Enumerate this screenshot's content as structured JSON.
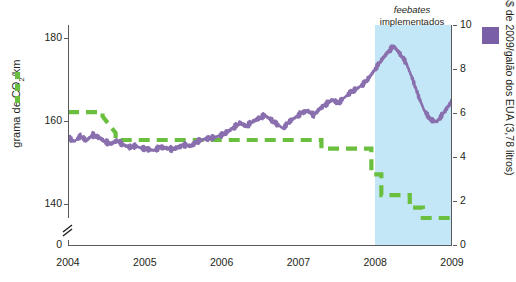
{
  "chart_data": {
    "type": "line",
    "title": "",
    "xlabel": "",
    "x_ticks": [
      "2004",
      "2005",
      "2006",
      "2007",
      "2008",
      "2009"
    ],
    "x_range": [
      2004,
      2009
    ],
    "grid": false,
    "annotations": [
      {
        "name": "feebate-annotation",
        "line1": "feebates",
        "line2": "implementados",
        "style": "italic-first-line"
      }
    ],
    "shaded_region": {
      "label": "feebates implementados",
      "from": 2008.0,
      "to": 2009.0,
      "color": "#c3e7f7"
    },
    "left_axis": {
      "label": "grama de CO₂/km",
      "ticks": [
        140,
        160,
        180
      ],
      "ylim": [
        130,
        183
      ],
      "axis_break": true,
      "zero_shown": "0"
    },
    "right_axis": {
      "label": "US$ de 2009/galão dos EUA (3,78 litros)",
      "ticks": [
        0,
        2,
        4,
        6,
        8,
        10
      ],
      "ylim": [
        0,
        10
      ]
    },
    "series": [
      {
        "name": "grama de CO₂/km",
        "axis": "left",
        "color": "#6abf3f",
        "style": "dashed-step",
        "x": [
          2004.0,
          2004.45,
          2004.45,
          2004.62,
          2004.62,
          2007.3,
          2007.3,
          2007.95,
          2007.95,
          2008.08,
          2008.08,
          2008.45,
          2008.45,
          2008.62,
          2008.62,
          2009.0
        ],
        "values": [
          162.0,
          162.0,
          161.0,
          157.0,
          155.3,
          155.3,
          153.2,
          153.2,
          147.0,
          147.0,
          142.0,
          142.0,
          139.0,
          139.0,
          136.5,
          136.5
        ]
      },
      {
        "name": "US$ de 2009/galão dos EUA (3,78 litros)",
        "axis": "right",
        "color": "#8a6fae",
        "style": "noisy-line",
        "x": [
          2004.0,
          2004.08,
          2004.16,
          2004.24,
          2004.32,
          2004.4,
          2004.48,
          2004.56,
          2004.64,
          2004.72,
          2004.8,
          2004.88,
          2004.96,
          2005.04,
          2005.12,
          2005.2,
          2005.28,
          2005.36,
          2005.44,
          2005.52,
          2005.6,
          2005.68,
          2005.76,
          2005.84,
          2005.92,
          2006.0,
          2006.08,
          2006.16,
          2006.24,
          2006.32,
          2006.4,
          2006.48,
          2006.56,
          2006.64,
          2006.72,
          2006.8,
          2006.88,
          2006.96,
          2007.04,
          2007.12,
          2007.2,
          2007.28,
          2007.36,
          2007.44,
          2007.52,
          2007.6,
          2007.68,
          2007.76,
          2007.84,
          2007.92,
          2008.0,
          2008.08,
          2008.16,
          2008.24,
          2008.32,
          2008.4,
          2008.48,
          2008.56,
          2008.64,
          2008.72,
          2008.8,
          2008.88,
          2008.96,
          2009.0
        ],
        "values": [
          4.9,
          4.7,
          4.95,
          4.75,
          5.0,
          4.9,
          4.7,
          4.6,
          4.75,
          4.55,
          4.45,
          4.5,
          4.4,
          4.35,
          4.3,
          4.45,
          4.4,
          4.35,
          4.45,
          4.55,
          4.5,
          4.7,
          4.8,
          4.85,
          4.9,
          5.0,
          5.15,
          5.35,
          5.55,
          5.4,
          5.6,
          5.75,
          5.9,
          5.7,
          5.5,
          5.3,
          5.6,
          5.8,
          6.0,
          6.1,
          5.9,
          6.2,
          6.4,
          6.6,
          6.45,
          6.7,
          6.95,
          7.1,
          7.3,
          7.6,
          8.0,
          8.4,
          8.75,
          9.05,
          8.7,
          8.3,
          7.6,
          6.8,
          6.1,
          5.7,
          5.6,
          5.95,
          6.35,
          6.55
        ]
      }
    ],
    "legend": [
      {
        "name": "legend-left",
        "swatch": "green-dashed",
        "color": "#6abf3f",
        "label": "grama de CO₂/km",
        "position": "left-axis"
      },
      {
        "name": "legend-right",
        "swatch": "purple-square",
        "color": "#7a5fa6",
        "label": "US$ de 2009/galão dos EUA (3,78 litros)",
        "position": "right-axis"
      }
    ]
  },
  "axes": {
    "left": {
      "title_pre": "grama de CO",
      "title_sub": "2",
      "title_post": "/km",
      "ticks": [
        {
          "label": "180",
          "value": 180
        },
        {
          "label": "160",
          "value": 160
        },
        {
          "label": "140",
          "value": 140
        },
        {
          "label": "0",
          "value": 0
        }
      ]
    },
    "right": {
      "title": "US$ de 2009/galão dos EUA (3,78 litros)",
      "ticks": [
        {
          "label": "10",
          "value": 10
        },
        {
          "label": "8",
          "value": 8
        },
        {
          "label": "6",
          "value": 6
        },
        {
          "label": "4",
          "value": 4
        },
        {
          "label": "2",
          "value": 2
        },
        {
          "label": "0",
          "value": 0
        }
      ]
    },
    "x": {
      "ticks": [
        {
          "label": "2004",
          "value": 2004
        },
        {
          "label": "2005",
          "value": 2005
        },
        {
          "label": "2006",
          "value": 2006
        },
        {
          "label": "2007",
          "value": 2007
        },
        {
          "label": "2008",
          "value": 2008
        },
        {
          "label": "2009",
          "value": 2009
        }
      ]
    }
  },
  "annotation": {
    "line1": "feebates",
    "line2": "implementados"
  },
  "colors": {
    "green": "#6abf3f",
    "purple": "#8a6fae",
    "purple_swatch": "#7a5fa6",
    "band": "#c3e7f7",
    "axis": "#58595b",
    "text": "#231f20"
  }
}
